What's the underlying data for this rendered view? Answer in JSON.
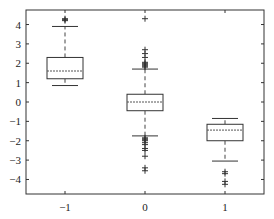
{
  "chart_data": {
    "type": "boxplot",
    "title": "",
    "xlabel": "",
    "ylabel": "",
    "categories": [
      "-1",
      "0",
      "1"
    ],
    "ylim": [
      -4.75,
      4.75
    ],
    "yticks": [
      -4,
      -3,
      -2,
      -1,
      0,
      1,
      2,
      3,
      4
    ],
    "ytick_labels": [
      "−4",
      "−3",
      "−2",
      "−1",
      "0",
      "1",
      "2",
      "3",
      "4"
    ],
    "xtick_labels": [
      "−1",
      "0",
      "1"
    ],
    "grid": false,
    "legend": null,
    "boxes": [
      {
        "category": "-1",
        "whisker_low": 0.85,
        "q1": 1.2,
        "median": 1.6,
        "q3": 2.3,
        "whisker_high": 3.9,
        "outliers": [
          4.2,
          4.25,
          4.3
        ]
      },
      {
        "category": "0",
        "whisker_low": -1.75,
        "q1": -0.45,
        "median": 0.0,
        "q3": 0.4,
        "whisker_high": 1.7,
        "outliers": [
          1.8,
          1.85,
          1.9,
          1.95,
          2.0,
          2.05,
          2.3,
          2.5,
          2.7,
          4.3,
          -1.85,
          -1.9,
          -1.95,
          -2.0,
          -2.1,
          -2.2,
          -2.4,
          -2.5,
          -2.8,
          -3.4,
          -3.55
        ]
      },
      {
        "category": "1",
        "whisker_low": -3.05,
        "q1": -2.0,
        "median": -1.45,
        "q3": -1.15,
        "whisker_high": -0.85,
        "outliers": [
          -3.6,
          -3.7,
          -4.1,
          -4.25
        ]
      }
    ]
  }
}
